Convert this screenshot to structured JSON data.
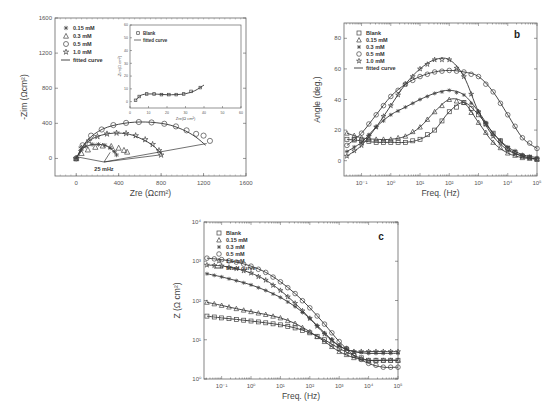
{
  "chart_data": [
    {
      "id": "a",
      "type": "scatter",
      "title": "",
      "panel_label": "a",
      "xlabel": "Zre (Ωcm²)",
      "ylabel": "-Zim (Ωcm²)",
      "xlim": [
        -200,
        1600
      ],
      "ylim": [
        -200,
        1600
      ],
      "xticks": [
        0,
        400,
        800,
        1200,
        1600
      ],
      "yticks": [
        0,
        400,
        800,
        1200,
        1600
      ],
      "legend": [
        "0.15 mM",
        "0.3 mM",
        "0.5 mM",
        "1.0 mM",
        "fitted curve"
      ],
      "legend_position": "top-left",
      "annotation": "25 mHz",
      "series": [
        {
          "name": "0.15 mM",
          "marker": "asterisk",
          "x": [
            0,
            40,
            90,
            150,
            210,
            270,
            320,
            360,
            380
          ],
          "y": [
            0,
            90,
            140,
            160,
            160,
            150,
            120,
            80,
            40
          ]
        },
        {
          "name": "0.3 mM",
          "marker": "triangle",
          "x": [
            0,
            50,
            110,
            180,
            250,
            330,
            400,
            450,
            480
          ],
          "y": [
            0,
            60,
            100,
            130,
            145,
            140,
            120,
            95,
            75
          ]
        },
        {
          "name": "0.5 mM",
          "marker": "circle",
          "x": [
            0,
            60,
            140,
            240,
            350,
            470,
            590,
            710,
            830,
            940,
            1040,
            1130,
            1200,
            1260
          ],
          "y": [
            0,
            150,
            260,
            330,
            380,
            405,
            415,
            410,
            395,
            365,
            320,
            280,
            260,
            200
          ]
        },
        {
          "name": "1.0 mM",
          "marker": "star",
          "x": [
            0,
            50,
            120,
            200,
            290,
            380,
            470,
            560,
            650,
            720,
            780,
            800
          ],
          "y": [
            0,
            120,
            200,
            250,
            280,
            290,
            285,
            260,
            215,
            160,
            90,
            40
          ]
        }
      ],
      "fits": [
        {
          "name": "0.15 mM fit",
          "x": [
            0,
            60,
            140,
            220,
            300,
            380
          ],
          "y": [
            0,
            110,
            155,
            160,
            135,
            50
          ]
        },
        {
          "name": "0.5 mM fit",
          "x": [
            0,
            100,
            250,
            450,
            650,
            850,
            1000,
            1120,
            1220
          ],
          "y": [
            0,
            200,
            335,
            400,
            415,
            390,
            330,
            250,
            150
          ]
        },
        {
          "name": "1.0 mM fit",
          "x": [
            0,
            80,
            200,
            350,
            500,
            620,
            720,
            790,
            810
          ],
          "y": [
            0,
            160,
            250,
            288,
            275,
            220,
            150,
            70,
            30
          ]
        }
      ],
      "inset": {
        "xlabel": "Zre(Ω cm²)",
        "ylabel": "-Zim(Ω cm²)",
        "xlim": [
          0,
          60
        ],
        "ylim": [
          -5,
          60
        ],
        "xticks": [
          0,
          10,
          20,
          30,
          40,
          50,
          60
        ],
        "yticks": [
          0,
          10,
          20,
          30,
          40,
          50,
          60
        ],
        "legend": [
          "Blank",
          "fitted curve"
        ],
        "series": [
          {
            "name": "Blank",
            "marker": "square",
            "x": [
              3,
              5,
              9,
              13,
              17,
              21,
              25,
              29,
              33,
              38
            ],
            "y": [
              1,
              4,
              6,
              6,
              5.5,
              5.5,
              5.5,
              6,
              8,
              11
            ]
          }
        ],
        "fit": {
          "x": [
            3,
            6,
            10,
            15,
            20,
            25,
            30,
            35,
            40
          ],
          "y": [
            1,
            5,
            6,
            5.8,
            5.4,
            5.5,
            6.2,
            8.5,
            13
          ]
        }
      }
    },
    {
      "id": "b",
      "type": "scatter",
      "panel_label": "b",
      "xlabel": "Freq. (Hz)",
      "ylabel": "Angle (deg.)",
      "xscale": "log",
      "xlim_log10": [
        -1.6,
        5
      ],
      "ylim": [
        -10,
        90
      ],
      "xtick_labels": [
        "10⁻¹",
        "10⁰",
        "10¹",
        "10²",
        "10³",
        "10⁴",
        "10⁵"
      ],
      "yticks": [
        0,
        20,
        40,
        60,
        80
      ],
      "legend": [
        "Blank",
        "0.15 mM",
        "0.3 mM",
        "0.5 mM",
        "1.0 mM",
        "fitted curve"
      ],
      "legend_position": "top-left",
      "log10_freq": [
        -1.5,
        -1,
        -0.5,
        0,
        0.5,
        1,
        1.5,
        2,
        2.5,
        3,
        3.5,
        4,
        4.5,
        5
      ],
      "series": [
        {
          "name": "Blank",
          "marker": "square",
          "y": [
            14,
            13,
            12,
            12,
            12,
            14,
            20,
            32,
            38,
            30,
            18,
            8,
            3,
            1
          ]
        },
        {
          "name": "0.15 mM",
          "marker": "triangle",
          "y": [
            18,
            15,
            14,
            14,
            16,
            22,
            32,
            40,
            38,
            25,
            12,
            5,
            2,
            1
          ]
        },
        {
          "name": "0.3 mM",
          "marker": "asterisk",
          "y": [
            6,
            12,
            22,
            30,
            35,
            40,
            44,
            46,
            43,
            32,
            18,
            9,
            4,
            2
          ]
        },
        {
          "name": "0.5 mM",
          "marker": "circle",
          "y": [
            10,
            18,
            30,
            42,
            50,
            55,
            58,
            59,
            58,
            55,
            45,
            30,
            15,
            8
          ]
        },
        {
          "name": "1.0 mM",
          "marker": "star",
          "y": [
            3,
            10,
            22,
            36,
            50,
            60,
            66,
            66,
            55,
            32,
            16,
            7,
            3,
            1
          ]
        }
      ]
    },
    {
      "id": "c",
      "type": "scatter",
      "panel_label": "c",
      "xlabel": "Freq. (Hz)",
      "ylabel": "Z (Ω cm²)",
      "xscale": "log",
      "yscale": "log",
      "xlim_log10": [
        -1.6,
        5
      ],
      "ylim_log10": [
        0,
        4
      ],
      "xtick_labels": [
        "10⁻¹",
        "10⁰",
        "10¹",
        "10²",
        "10³",
        "10⁴",
        "10⁵"
      ],
      "ytick_labels": [
        "10⁰",
        "10¹",
        "10²",
        "10³",
        "10⁴"
      ],
      "legend": [
        "Blank",
        "0.15 mM",
        "0.3 mM",
        "0.5 mM",
        "1.0 mM",
        "fitted curve"
      ],
      "legend_position": "top-left",
      "log10_freq": [
        -1.5,
        -1,
        -0.5,
        0,
        0.5,
        1,
        1.5,
        2,
        2.5,
        3,
        3.5,
        4,
        4.5,
        5
      ],
      "series": [
        {
          "name": "Blank",
          "marker": "square",
          "y": [
            40,
            36,
            33,
            30,
            27,
            24,
            20,
            15,
            10,
            6,
            4,
            3,
            3,
            3
          ]
        },
        {
          "name": "0.15 mM",
          "marker": "triangle",
          "y": [
            90,
            75,
            62,
            52,
            44,
            36,
            26,
            16,
            9,
            5,
            3.5,
            3,
            3,
            3
          ]
        },
        {
          "name": "0.3 mM",
          "marker": "asterisk",
          "y": [
            480,
            400,
            320,
            250,
            180,
            120,
            70,
            35,
            15,
            7,
            5,
            4.5,
            4.5,
            4.5
          ]
        },
        {
          "name": "0.5 mM",
          "marker": "circle",
          "y": [
            1200,
            1100,
            950,
            750,
            520,
            300,
            150,
            65,
            25,
            9,
            4,
            2.5,
            2,
            2
          ]
        },
        {
          "name": "1.0 mM",
          "marker": "star",
          "y": [
            800,
            760,
            650,
            500,
            330,
            180,
            85,
            35,
            14,
            7,
            5,
            5,
            5,
            5
          ]
        }
      ]
    }
  ]
}
